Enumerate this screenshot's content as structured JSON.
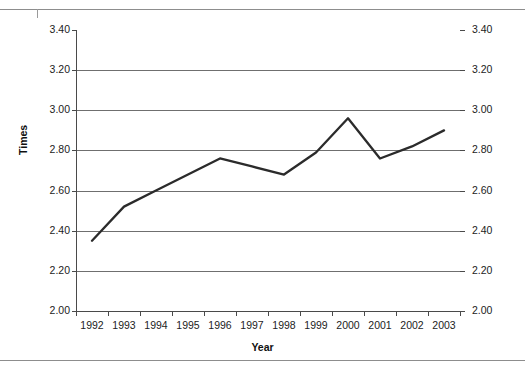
{
  "chart_data": {
    "type": "line",
    "title": "",
    "xlabel": "Year",
    "ylabel": "Times",
    "categories": [
      "1992",
      "1993",
      "1994",
      "1995",
      "1996",
      "1997",
      "1998",
      "1999",
      "2000",
      "2001",
      "2002",
      "2003"
    ],
    "values": [
      2.35,
      2.52,
      2.6,
      2.68,
      2.76,
      2.72,
      2.68,
      2.79,
      2.96,
      2.76,
      2.82,
      2.9
    ],
    "series": [
      {
        "name": "Times",
        "values": [
          2.35,
          2.52,
          2.6,
          2.68,
          2.76,
          2.72,
          2.68,
          2.79,
          2.96,
          2.76,
          2.82,
          2.9
        ]
      }
    ],
    "ylim": [
      2.0,
      3.4
    ],
    "ytick_values": [
      3.4,
      3.2,
      3.0,
      2.8,
      2.6,
      2.4,
      2.2,
      2.0
    ],
    "ytick_labels_left": [
      "3.40",
      "3.20",
      "3.00",
      "2.80",
      "2.60",
      "2.40",
      "2.20",
      "2.00"
    ],
    "ytick_labels_right": [
      "3.40",
      "3.20",
      "3.00",
      "2.80",
      "2.60",
      "2.40",
      "2.20",
      "2.00"
    ],
    "grid": true,
    "legend": "none",
    "line_color": "#2b2b2b",
    "grid_color": "#6f6f6f",
    "axis_color": "#4a4a4a",
    "dual_y_axis": true
  },
  "axes": {
    "y_title": "Times",
    "x_title": "Year"
  }
}
